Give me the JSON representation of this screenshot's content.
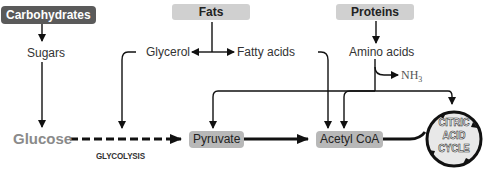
{
  "sources": {
    "carbohydrates": "Carbohydrates",
    "fats": "Fats",
    "proteins": "Proteins"
  },
  "intermediates": {
    "sugars": "Sugars",
    "glycerol": "Glycerol",
    "fatty_acids": "Fatty acids",
    "amino_acids": "Amino acids",
    "nh3": "NH",
    "nh3_sub": "3"
  },
  "pathway": {
    "glucose": "Glucose",
    "glycolysis": "GLYCOLYSIS",
    "pyruvate": "Pyruvate",
    "acetyl_coa": "Acetyl CoA",
    "cycle_line1": "CITRIC",
    "cycle_line2": "ACID",
    "cycle_line3": "CYCLE"
  },
  "colors": {
    "dark_box": "#5a5a5a",
    "light_box": "#d0d0d0",
    "mid_box": "#b8b8b8",
    "glucose_text": "#8a8a8a",
    "line": "#111111"
  }
}
